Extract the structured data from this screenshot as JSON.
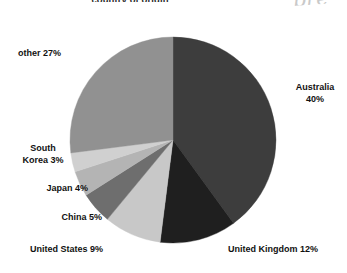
{
  "chart_data": {
    "type": "pie",
    "title": "country of origin",
    "xlabel": "",
    "ylabel": "",
    "grid": false,
    "legend_position": "none",
    "labels_mode": "outside-callout",
    "start_angle_deg": 0,
    "direction": "clockwise",
    "categories": [
      "Australia",
      "United Kingdom",
      "United States",
      "China",
      "Japan",
      "South Korea",
      "other"
    ],
    "values": [
      40,
      12,
      9,
      5,
      4,
      3,
      27
    ],
    "units": "percent",
    "colors": [
      "#3d3d3d",
      "#1f1f1f",
      "#c8c8c8",
      "#6e6e6e",
      "#b4b4b4",
      "#d0d0d0",
      "#919191"
    ],
    "slices": [
      {
        "name": "Australia",
        "value": 40,
        "label": "Australia\n40%",
        "color": "#3d3d3d"
      },
      {
        "name": "United Kingdom",
        "value": 12,
        "label": "United Kingdom 12%",
        "color": "#1f1f1f"
      },
      {
        "name": "United States",
        "value": 9,
        "label": "United States 9%",
        "color": "#c8c8c8"
      },
      {
        "name": "China",
        "value": 5,
        "label": "China 5%",
        "color": "#6e6e6e"
      },
      {
        "name": "Japan",
        "value": 4,
        "label": "Japan 4%",
        "color": "#b4b4b4"
      },
      {
        "name": "South Korea",
        "value": 3,
        "label": "South\nKorea 3%",
        "color": "#d0d0d0"
      },
      {
        "name": "other",
        "value": 27,
        "label": "other 27%",
        "color": "#919191"
      }
    ]
  },
  "annotation": {
    "handwriting": "pre"
  },
  "geometry": {
    "center_x": 173,
    "center_y": 140,
    "radius": 103
  }
}
